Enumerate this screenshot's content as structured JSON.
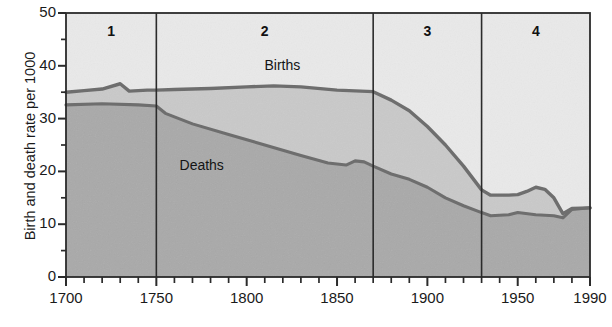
{
  "chart_data": {
    "type": "area",
    "title": "",
    "xlabel": "",
    "ylabel": "Birth and death rate per 1000",
    "xlim": [
      1700,
      1990
    ],
    "ylim": [
      0,
      50
    ],
    "grid": false,
    "legend_position": "inline-annotations",
    "x_ticks": [
      1700,
      1750,
      1800,
      1850,
      1900,
      1950,
      1990
    ],
    "x_tick_labels": [
      "1700",
      "1750",
      "1800",
      "1850",
      "1900",
      "1950",
      "1990"
    ],
    "x_minor_tick_step": 10,
    "y_ticks": [
      0,
      10,
      20,
      30,
      40,
      50
    ],
    "y_tick_labels": [
      "0",
      "10",
      "20",
      "30",
      "40",
      "50"
    ],
    "y_minor_ticks": [
      5,
      15,
      25,
      35,
      45
    ],
    "series": [
      {
        "name": "Births",
        "color": "#6e6e6e",
        "x": [
          1700,
          1710,
          1720,
          1730,
          1735,
          1745,
          1750,
          1760,
          1780,
          1800,
          1815,
          1830,
          1850,
          1870,
          1880,
          1890,
          1900,
          1910,
          1920,
          1930,
          1935,
          1945,
          1950,
          1955,
          1960,
          1965,
          1970,
          1975,
          1980,
          1990
        ],
        "y": [
          35.0,
          35.3,
          35.6,
          36.6,
          35.2,
          35.4,
          35.4,
          35.5,
          35.7,
          36.0,
          36.2,
          36.0,
          35.4,
          35.1,
          33.5,
          31.5,
          28.5,
          25.0,
          21.0,
          16.5,
          15.5,
          15.5,
          15.6,
          16.2,
          17.0,
          16.6,
          15.0,
          12.0,
          13.0,
          13.1
        ]
      },
      {
        "name": "Deaths",
        "color": "#6e6e6e",
        "x": [
          1700,
          1720,
          1740,
          1750,
          1755,
          1770,
          1790,
          1810,
          1830,
          1845,
          1855,
          1860,
          1865,
          1870,
          1880,
          1890,
          1900,
          1910,
          1920,
          1930,
          1935,
          1945,
          1950,
          1960,
          1970,
          1975,
          1980,
          1990
        ],
        "y": [
          32.6,
          32.8,
          32.6,
          32.4,
          31.0,
          29.0,
          27.0,
          25.0,
          23.0,
          21.6,
          21.2,
          22.0,
          21.8,
          21.0,
          19.5,
          18.5,
          17.0,
          15.0,
          13.5,
          12.2,
          11.6,
          11.8,
          12.2,
          11.8,
          11.6,
          11.2,
          12.8,
          13.1
        ]
      }
    ],
    "stages": [
      {
        "label": "1",
        "start": 1700,
        "end": 1750
      },
      {
        "label": "2",
        "start": 1750,
        "end": 1870
      },
      {
        "label": "3",
        "start": 1870,
        "end": 1930
      },
      {
        "label": "4",
        "start": 1930,
        "end": 1990
      }
    ],
    "annotations": [
      {
        "text": "Births",
        "x": 1822,
        "y": 40.0
      },
      {
        "text": "Deaths",
        "x": 1775,
        "y": 21.0
      }
    ],
    "fill_colors": {
      "above_births": "#e9e9e9",
      "between_births_and_deaths": "#c9c9c9",
      "below_deaths": "#a9a9a9"
    },
    "axis_color": "#2b2b2b",
    "stage_divider_color": "#2b2b2b"
  }
}
